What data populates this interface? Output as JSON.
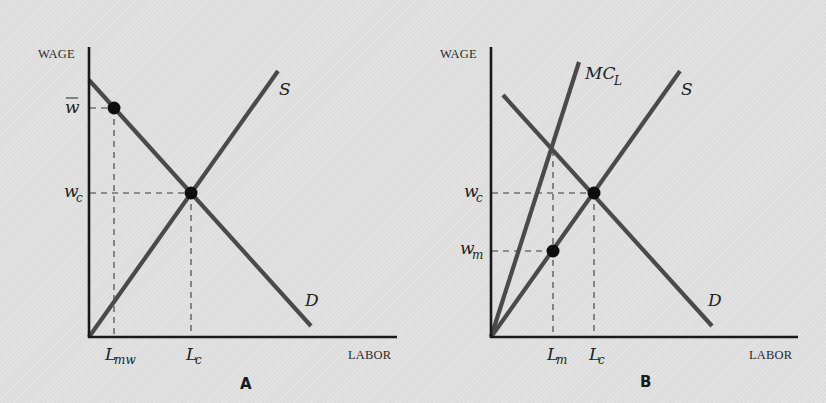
{
  "panels": [
    {
      "id": "A",
      "panel_label": "A",
      "y_axis_label": "WAGE",
      "x_axis_label": "LABOR",
      "curves": {
        "supply": "S",
        "demand": "D"
      },
      "y_ticks": {
        "min_wage": "w",
        "competitive_wage_base": "w",
        "competitive_wage_sub": "c"
      },
      "x_ticks": {
        "min_wage_labor_base": "L",
        "min_wage_labor_sub": "mw",
        "competitive_labor_base": "L",
        "competitive_labor_sub": "c"
      }
    },
    {
      "id": "B",
      "panel_label": "B",
      "y_axis_label": "WAGE",
      "x_axis_label": "LABOR",
      "curves": {
        "marginal_cost_base": "MC",
        "marginal_cost_sub": "L",
        "supply": "S",
        "demand": "D"
      },
      "y_ticks": {
        "competitive_wage_base": "w",
        "competitive_wage_sub": "c",
        "monopsony_wage_base": "w",
        "monopsony_wage_sub": "m"
      },
      "x_ticks": {
        "monopsony_labor_base": "L",
        "monopsony_labor_sub": "m",
        "competitive_labor_base": "L",
        "competitive_labor_sub": "c"
      }
    }
  ],
  "colors": {
    "background": "#e1e1e1",
    "axis": "#1a1a1a",
    "curve": "#4a4a4a",
    "point": "#0d0d0d"
  }
}
